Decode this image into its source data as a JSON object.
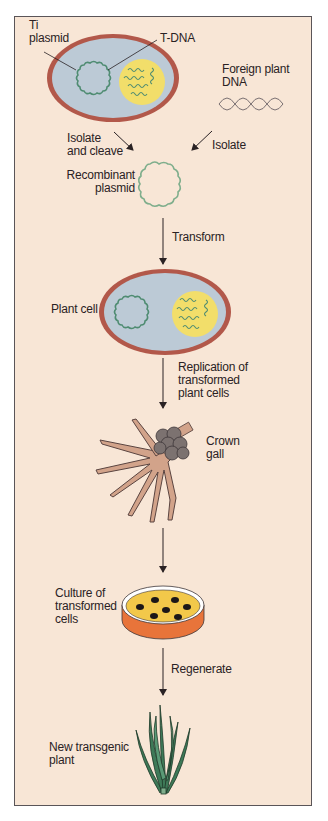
{
  "diagram": {
    "colors": {
      "background": "#f8e6d6",
      "frame_border": "#5a5558",
      "cell_wall": "#b2584a",
      "cytoplasm": "#bccad6",
      "nucleus": "#f2de6a",
      "plasmid": "#4f8c72",
      "root": "#d2a38a",
      "gall": "#7c7270",
      "agar": "#f2c84a",
      "dish_base": "#e8743a",
      "colony": "#1b1718",
      "leaf": "#3e7a58",
      "arrow": "#2a2224"
    },
    "labels": {
      "ti_plasmid": [
        "Ti",
        "plasmid"
      ],
      "t_dna": "T-DNA",
      "foreign_dna": [
        "Foreign plant",
        "DNA"
      ],
      "isolate_cleave": [
        "Isolate",
        "and cleave"
      ],
      "isolate": "Isolate",
      "recombinant": [
        "Recombinant",
        "plasmid"
      ],
      "transform": "Transform",
      "plant_cell": "Plant cell",
      "replication": [
        "Replication of",
        "transformed",
        "plant cells"
      ],
      "crown_gall": [
        "Crown",
        "gall"
      ],
      "culture": [
        "Culture of",
        "transformed",
        "cells"
      ],
      "regenerate": "Regenerate",
      "new_plant": [
        "New transgenic",
        "plant"
      ]
    },
    "steps": [
      {
        "from": "Ti plasmid + Foreign plant DNA",
        "action": "Isolate and cleave / Isolate",
        "to": "Recombinant plasmid"
      },
      {
        "from": "Recombinant plasmid",
        "action": "Transform",
        "to": "Plant cell"
      },
      {
        "from": "Plant cell",
        "action": "Replication of transformed plant cells",
        "to": "Crown gall"
      },
      {
        "from": "Crown gall",
        "action": "",
        "to": "Culture of transformed cells"
      },
      {
        "from": "Culture of transformed cells",
        "action": "Regenerate",
        "to": "New transgenic plant"
      }
    ]
  }
}
